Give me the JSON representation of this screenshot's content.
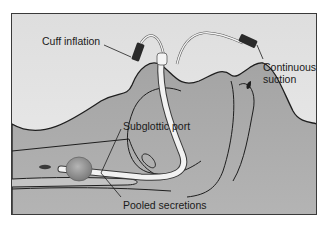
{
  "diagram": {
    "labels": {
      "cuff_inflation": "Cuff inflation",
      "continuous_suction": "Continuous suction",
      "continuous_suction_line1": "Continuous",
      "continuous_suction_line2": "suction",
      "subglottic_port": "Subglottic port",
      "pooled_secretions": "Pooled secretions"
    },
    "colors": {
      "background": "#e2e2e2",
      "tissue": "#a9a9a9",
      "tissue_dark": "#8f8f8f",
      "outline": "#1e1e1e",
      "tube": "#f2f2f2",
      "connector": "#2a2a2a",
      "cuff": "#8a8a8a"
    }
  }
}
